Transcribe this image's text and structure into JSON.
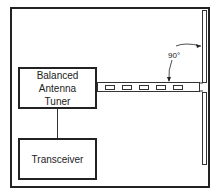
{
  "diagram": {
    "nodes": [
      {
        "id": "tuner",
        "label_lines": [
          "Balanced",
          "Antenna",
          "Tuner"
        ]
      },
      {
        "id": "transceiver",
        "label": "Transceiver"
      }
    ],
    "feedline": {
      "type": "ladder-line",
      "slot_count": 5
    },
    "antenna": {
      "type": "dipole",
      "orientation": "vertical"
    },
    "annotation": {
      "angle_label": "90°"
    },
    "edges": [
      {
        "from": "transceiver",
        "to": "tuner"
      },
      {
        "from": "tuner",
        "to": "antenna",
        "via": "ladder-line"
      }
    ]
  }
}
